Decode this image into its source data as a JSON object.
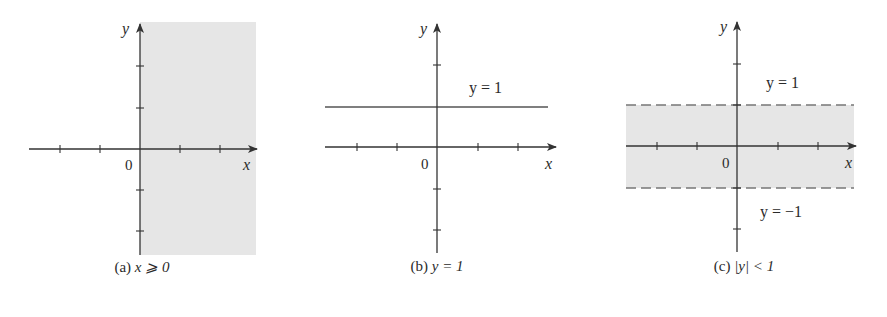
{
  "colors": {
    "shade": "#e6e6e6",
    "axis": "#333333",
    "line": "#555555",
    "dashed": "#777777"
  },
  "panels": [
    {
      "id": "a",
      "caption_prefix": "(a) ",
      "caption_math": "x ⩾ 0",
      "x_label": "x",
      "y_label": "y",
      "origin_label": "0",
      "region": "x >= 0 shaded"
    },
    {
      "id": "b",
      "caption_prefix": "(b) ",
      "caption_math": "y = 1",
      "x_label": "x",
      "y_label": "y",
      "origin_label": "0",
      "line_label": "y = 1"
    },
    {
      "id": "c",
      "caption_prefix": "(c) ",
      "caption_math": "|y| < 1",
      "x_label": "x",
      "y_label": "y",
      "origin_label": "0",
      "upper_label": "y = 1",
      "lower_label": "y = −1"
    }
  ]
}
